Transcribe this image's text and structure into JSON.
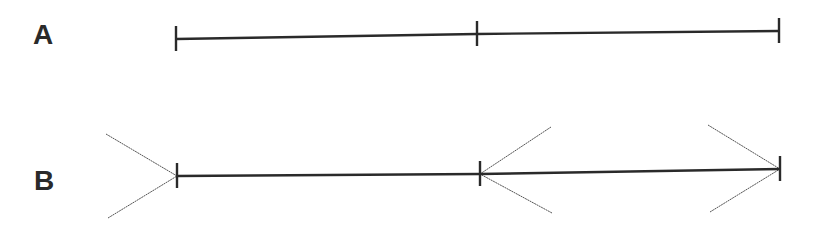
{
  "figure": {
    "colors": {
      "line": "#2a2a2a",
      "fin": "#555555",
      "background": "#ffffff"
    }
  },
  "rows": [
    {
      "label": "A",
      "description": "Plain line divided into two equal segments by tick marks",
      "ticks": [
        {
          "x": 176,
          "y": 39
        },
        {
          "x": 477,
          "y": 34
        },
        {
          "x": 779,
          "y": 31
        }
      ],
      "fins": []
    },
    {
      "label": "B",
      "description": "Same segments with arrowhead fins (outward fins on left segment, inward fins on right segment)",
      "ticks": [
        {
          "x": 177,
          "y": 176
        },
        {
          "x": 480,
          "y": 174
        },
        {
          "x": 780,
          "y": 169
        }
      ],
      "fins": [
        {
          "x1": 106,
          "y1": 134,
          "x2": 177,
          "y2": 176
        },
        {
          "x1": 108,
          "y1": 218,
          "x2": 177,
          "y2": 176
        },
        {
          "x1": 551,
          "y1": 127,
          "x2": 480,
          "y2": 174
        },
        {
          "x1": 552,
          "y1": 213,
          "x2": 480,
          "y2": 174
        },
        {
          "x1": 708,
          "y1": 125,
          "x2": 780,
          "y2": 169
        },
        {
          "x1": 710,
          "y1": 212,
          "x2": 780,
          "y2": 169
        }
      ]
    }
  ]
}
